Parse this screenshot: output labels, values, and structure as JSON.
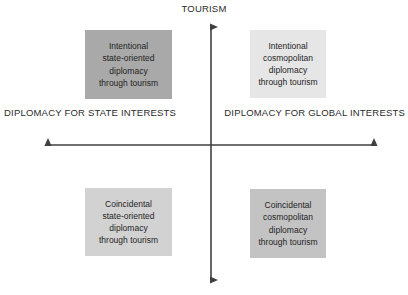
{
  "diagram": {
    "type": "quadrant-matrix",
    "axes": {
      "vertical": {
        "top_label": "TOURISM",
        "arrows": "both",
        "color": "#404040",
        "x_position": 211,
        "top_y": 19,
        "bottom_y": 288
      },
      "horizontal": {
        "left_label_lines": [
          "DIPLOMACY FOR",
          "STATE INTERESTS"
        ],
        "right_label_lines": [
          "DIPLOMACY FOR",
          "GLOBAL INTERESTS"
        ],
        "arrows": "both",
        "color": "#404040",
        "y_position": 145,
        "left_x": 40,
        "right_x": 382
      }
    },
    "quadrants": [
      {
        "position": "top-left",
        "name": "intentional-state-oriented",
        "lines": [
          "Intentional",
          "state-oriented",
          "diplomacy",
          "through tourism"
        ],
        "fill": "#a9a9a9"
      },
      {
        "position": "top-right",
        "name": "intentional-cosmopolitan",
        "lines": [
          "Intentional",
          "cosmopolitan",
          "diplomacy",
          "through tourism"
        ],
        "fill": "#e6e6e6"
      },
      {
        "position": "bottom-left",
        "name": "coincidental-state-oriented",
        "lines": [
          "Coincidental",
          "state-oriented",
          "diplomacy",
          "through tourism"
        ],
        "fill": "#d2d2d2"
      },
      {
        "position": "bottom-right",
        "name": "coincidental-cosmopolitan",
        "lines": [
          "Coincidental",
          "cosmopolitan",
          "diplomacy",
          "through tourism"
        ],
        "fill": "#c3c3c3"
      }
    ]
  }
}
